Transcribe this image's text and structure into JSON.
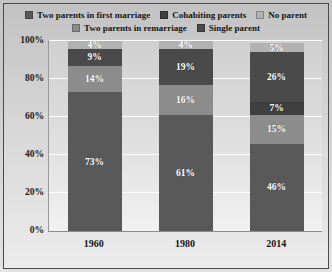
{
  "chart_data": {
    "type": "bar",
    "subtype": "stacked-percent-column",
    "title": "",
    "xlabel": "",
    "ylabel": "",
    "ylim": [
      0,
      100
    ],
    "yticks": [
      "0%",
      "20%",
      "40%",
      "60%",
      "80%",
      "100%"
    ],
    "grid": true,
    "legend_position": "top",
    "categories": [
      "1960",
      "1980",
      "2014"
    ],
    "series": [
      {
        "name": "Two parents in first marriage",
        "color": "#595959",
        "values": [
          73,
          61,
          46
        ],
        "labels": [
          "73%",
          "61%",
          "46%"
        ]
      },
      {
        "name": "Two parents in remarriage",
        "color": "#8c8c8c",
        "values": [
          14,
          16,
          15
        ],
        "labels": [
          "14%",
          "16%",
          "15%"
        ]
      },
      {
        "name": "Cohabiting parents",
        "color": "#3f3f3f",
        "values": [
          0,
          0,
          7
        ],
        "labels": [
          "",
          "",
          "7%"
        ]
      },
      {
        "name": "Single parent",
        "color": "#4a4a4a",
        "values": [
          9,
          19,
          26
        ],
        "labels": [
          "9%",
          "19%",
          "26%"
        ]
      },
      {
        "name": "No parent",
        "color": "#b2b2b2",
        "values": [
          4,
          4,
          5
        ],
        "labels": [
          "4%",
          "4%",
          "5%"
        ]
      }
    ]
  },
  "legend": {
    "rows": [
      [
        {
          "label": "Two parents in first marriage",
          "color": "#595959",
          "icon": "legend-swatch-icon"
        },
        {
          "label": "Cohabiting parents",
          "color": "#3f3f3f",
          "icon": "legend-swatch-icon"
        },
        {
          "label": "No parent",
          "color": "#b2b2b2",
          "icon": "legend-swatch-icon"
        }
      ],
      [
        {
          "label": "Two parents in remarriage",
          "color": "#8c8c8c",
          "icon": "legend-swatch-icon"
        },
        {
          "label": "Single parent",
          "color": "#4a4a4a",
          "icon": "legend-swatch-icon"
        }
      ]
    ]
  },
  "axis": {
    "y_ticks": [
      "100%",
      "80%",
      "60%",
      "40%",
      "20%",
      "0%"
    ],
    "x_ticks": [
      "1960",
      "1980",
      "2014"
    ]
  },
  "bars": [
    {
      "category": "1960",
      "segments": [
        {
          "series": "No parent",
          "label": "4%",
          "value": 4,
          "color": "#b2b2b2"
        },
        {
          "series": "Single parent",
          "label": "9%",
          "value": 9,
          "color": "#4a4a4a"
        },
        {
          "series": "Two parents in remarriage",
          "label": "14%",
          "value": 14,
          "color": "#8c8c8c"
        },
        {
          "series": "Two parents in first marriage",
          "label": "73%",
          "value": 73,
          "color": "#595959"
        }
      ]
    },
    {
      "category": "1980",
      "segments": [
        {
          "series": "No parent",
          "label": "4%",
          "value": 4,
          "color": "#b2b2b2"
        },
        {
          "series": "Single parent",
          "label": "19%",
          "value": 19,
          "color": "#4a4a4a"
        },
        {
          "series": "Two parents in remarriage",
          "label": "16%",
          "value": 16,
          "color": "#8c8c8c"
        },
        {
          "series": "Two parents in first marriage",
          "label": "61%",
          "value": 61,
          "color": "#595959"
        }
      ]
    },
    {
      "category": "2014",
      "segments": [
        {
          "series": "No parent",
          "label": "5%",
          "value": 5,
          "color": "#b2b2b2"
        },
        {
          "series": "Single parent",
          "label": "26%",
          "value": 26,
          "color": "#4a4a4a"
        },
        {
          "series": "Cohabiting parents",
          "label": "7%",
          "value": 7,
          "color": "#3f3f3f"
        },
        {
          "series": "Two parents in remarriage",
          "label": "15%",
          "value": 15,
          "color": "#8c8c8c"
        },
        {
          "series": "Two parents in first marriage",
          "label": "46%",
          "value": 46,
          "color": "#595959"
        }
      ]
    }
  ]
}
